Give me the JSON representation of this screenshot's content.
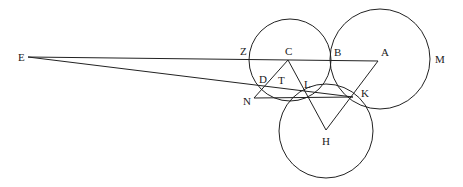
{
  "diagram": {
    "stroke_color": "#222222",
    "points": {
      "E": {
        "label": "E",
        "x": 28,
        "y": 57
      },
      "Z": {
        "label": "Z",
        "x": 251,
        "y": 59
      },
      "C": {
        "label": "C",
        "x": 288,
        "y": 60
      },
      "B": {
        "label": "B",
        "x": 331,
        "y": 61
      },
      "A": {
        "label": "A",
        "x": 378,
        "y": 61
      },
      "M": {
        "label": "M",
        "x": 430,
        "y": 59
      },
      "D": {
        "label": "D",
        "x": 263,
        "y": 88
      },
      "T": {
        "label": "T",
        "x": 279,
        "y": 82
      },
      "L": {
        "label": "L",
        "x": 306,
        "y": 94
      },
      "K": {
        "label": "K",
        "x": 353,
        "y": 97
      },
      "N": {
        "label": "N",
        "x": 254,
        "y": 98
      },
      "H": {
        "label": "H",
        "x": 326,
        "y": 130
      }
    },
    "circles": [
      {
        "name": "circle-ZCB",
        "cx": 290,
        "cy": 60,
        "r": 41
      },
      {
        "name": "circle-BAM",
        "cx": 380,
        "cy": 59,
        "r": 50
      },
      {
        "name": "circle-LKH",
        "cx": 326,
        "cy": 131,
        "r": 47
      }
    ],
    "segments": [
      {
        "name": "line-E-A",
        "from": "E",
        "to": "A"
      },
      {
        "name": "line-E-K",
        "from": "E",
        "to": "K"
      },
      {
        "name": "line-C-H",
        "from": "C",
        "to": "H"
      },
      {
        "name": "line-A-H",
        "from": "A",
        "to": "H"
      },
      {
        "name": "line-C-N",
        "from": "C",
        "to": "N"
      },
      {
        "name": "line-N-K",
        "from": "N",
        "to": "K"
      }
    ],
    "labels": [
      {
        "key": "E",
        "text": "E",
        "x": 18,
        "y": 52
      },
      {
        "key": "Z",
        "text": "Z",
        "x": 240,
        "y": 46
      },
      {
        "key": "C",
        "text": "C",
        "x": 285,
        "y": 46
      },
      {
        "key": "B",
        "text": "B",
        "x": 334,
        "y": 47
      },
      {
        "key": "A",
        "text": "A",
        "x": 381,
        "y": 47
      },
      {
        "key": "M",
        "text": "M",
        "x": 435,
        "y": 54
      },
      {
        "key": "D",
        "text": "D",
        "x": 259,
        "y": 74
      },
      {
        "key": "T",
        "text": "T",
        "x": 278,
        "y": 75
      },
      {
        "key": "L",
        "text": "L",
        "x": 304,
        "y": 79
      },
      {
        "key": "K",
        "text": "K",
        "x": 361,
        "y": 88
      },
      {
        "key": "N",
        "text": "N",
        "x": 243,
        "y": 96
      },
      {
        "key": "H",
        "text": "H",
        "x": 322,
        "y": 136
      }
    ]
  }
}
